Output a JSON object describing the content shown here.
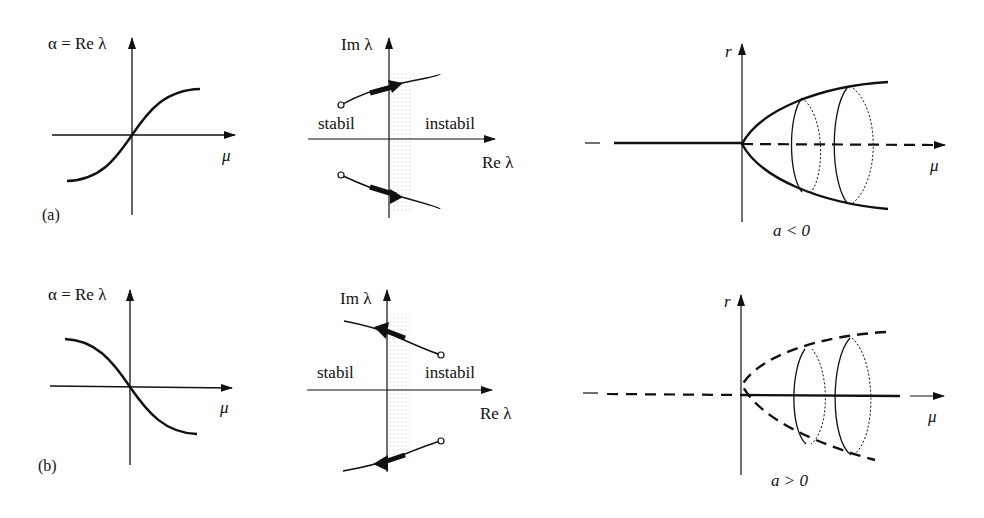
{
  "panel_a": {
    "tag": "(a)",
    "re_plot": {
      "ylabel": "α = Re λ",
      "xlabel": "μ",
      "curve": "increasing sigmoid through origin"
    },
    "eigen_plot": {
      "ylabel": "Im λ",
      "xlabel": "Re λ",
      "left_region": "stabil",
      "right_region": "instabil",
      "direction": "eigenvalues cross imaginary axis from left to right"
    },
    "bif_plot": {
      "ylabel": "r",
      "xlabel": "μ",
      "condition": "a < 0",
      "type": "supercritical Hopf: stable branch solid for μ<0, dashed (unstable) for μ>0; stable limit cycles (solid paraboloid)"
    }
  },
  "panel_b": {
    "tag": "(b)",
    "re_plot": {
      "ylabel": "α = Re λ",
      "xlabel": "μ",
      "curve": "decreasing sigmoid through origin"
    },
    "eigen_plot": {
      "ylabel": "Im λ",
      "xlabel": "Re λ",
      "left_region": "stabil",
      "right_region": "instabil",
      "direction": "eigenvalues cross imaginary axis from right to left"
    },
    "bif_plot": {
      "ylabel": "r",
      "xlabel": "μ",
      "condition": "a > 0",
      "type": "subcritical Hopf: dashed for μ<0, solid for μ>0; unstable limit cycles (dashed paraboloid)"
    }
  }
}
